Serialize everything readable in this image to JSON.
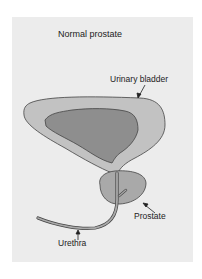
{
  "title": "Normal prostate",
  "labels": {
    "bladder": "Urinary bladder",
    "prostate": "Prostate",
    "urethra": "Urethra"
  },
  "colors": {
    "background": "#ececec",
    "bladder_wall": "#c2c2c2",
    "bladder_lumen": "#8e8e8e",
    "prostate": "#a9a9a9",
    "outline": "#444444"
  }
}
